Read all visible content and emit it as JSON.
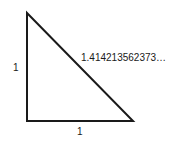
{
  "diagram": {
    "type": "right-triangle",
    "stroke_color": "#1a1a1a",
    "background": "#ffffff",
    "vertices": {
      "apex": [
        27,
        13
      ],
      "right_angle": [
        27,
        121
      ],
      "base_end": [
        133,
        121
      ]
    },
    "labels": {
      "vertical_leg": "1",
      "horizontal_leg": "1",
      "hypotenuse": "1.414213562373…"
    }
  }
}
